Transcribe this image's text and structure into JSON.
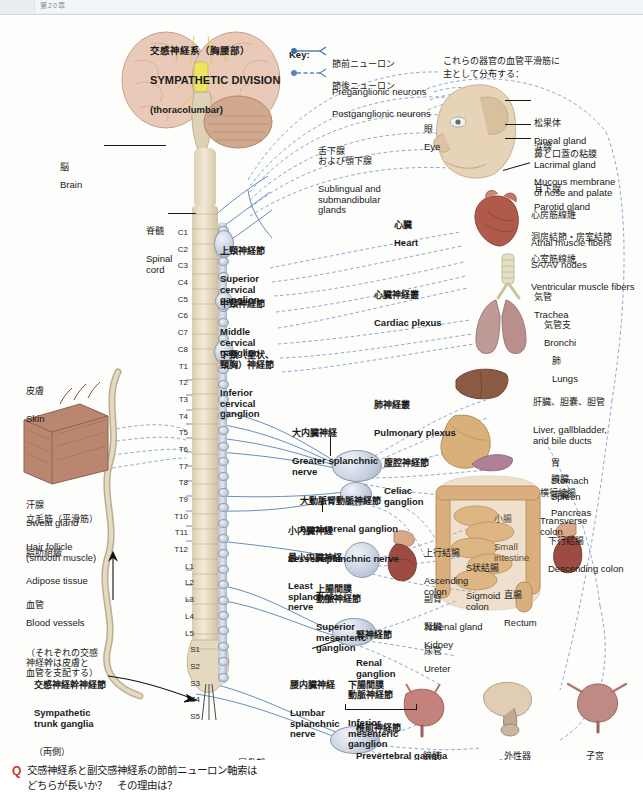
{
  "page": {
    "edge_label": "第20章",
    "width": 643,
    "height": 812
  },
  "title": {
    "jp": "交感神経系（胸腰部）",
    "en": "SYMPATHETIC DIVISION",
    "sub": "(thoracolumbar)"
  },
  "key": {
    "heading": "Key:",
    "items": [
      {
        "jp": "節前ニューロン",
        "en": "Preganglionic neurons",
        "style": "solid",
        "color": "#3f6fa8"
      },
      {
        "jp": "節後ニューロン",
        "en": "Postganglionic neurons",
        "style": "dashed",
        "color": "#3f6fa8"
      }
    ]
  },
  "note_vascular": "これらの器官の血管平滑筋に\n主として分布する：",
  "cns_labels": [
    {
      "jp": "脳",
      "en": "Brain"
    },
    {
      "jp": "脊髄",
      "en": "Spinal\ncord"
    }
  ],
  "spinal_segments": [
    "C1",
    "C2",
    "C3",
    "C4",
    "C5",
    "C6",
    "C7",
    "C8",
    "T1",
    "T2",
    "T3",
    "T4",
    "T5",
    "T6",
    "T7",
    "T8",
    "T9",
    "T10",
    "T11",
    "T12",
    "L1",
    "L2",
    "L3",
    "L4",
    "L5",
    "S1",
    "S2",
    "S3",
    "S4",
    "S5"
  ],
  "coccygeal": {
    "jp": "尾骨部",
    "en": "Coccygeal",
    "note": "（融合する）"
  },
  "cervical_ganglia": [
    {
      "jp": "上頸神経節",
      "en": "Superior\ncervical\nganglion"
    },
    {
      "jp": "中頸神経節",
      "en": "Middle\ncervical\nganglion"
    },
    {
      "jp": "下頸（星状、\n頸胸）神経節",
      "en": "Inferior\ncervical\nganglion"
    }
  ],
  "trunk_ganglia": {
    "jp": "交感神経幹神経節",
    "en": "Sympathetic\ntrunk ganglia",
    "note": "（両側）"
  },
  "splanchnic_nerves": [
    {
      "jp": "大内臓神経",
      "en": "Greater splanchnic\nnerve"
    },
    {
      "jp": "小内臓神経",
      "en": "Lesser splanchnic nerve"
    },
    {
      "jp": "最小内臓神経",
      "en": "Least\nsplanchnic\nnerve"
    },
    {
      "jp": "腰内臓神経",
      "en": "Lumbar\nsplanchnic\nnerve"
    }
  ],
  "prevertebral_ganglia": [
    {
      "jp": "腹腔神経節",
      "en": "Celiac\nganglion"
    },
    {
      "jp": "大動脈腎動脈神経節",
      "en": "Aorticorenal ganglion"
    },
    {
      "jp": "上腸間膜\n動脈神経節",
      "en": "Superior\nmesenteric\nganglion"
    },
    {
      "jp": "腎神経節",
      "en": "Renal\nganglion"
    },
    {
      "jp": "下腸間膜\n動脈神経節",
      "en": "Inferior\nmesenteric\nganglion"
    }
  ],
  "prevertebral_group": {
    "jp": "椎前神経節",
    "en": "Prevertebral ganglia"
  },
  "plexuses": [
    {
      "jp": "心臓神経叢",
      "en": "Cardiac plexus"
    },
    {
      "jp": "肺神経叢",
      "en": "Pulmonary plexus"
    },
    {
      "jp": "下腹神経叢",
      "en": "Hypogastric plexus"
    }
  ],
  "skin_block": {
    "title": {
      "jp": "皮膚",
      "en": "Skin"
    },
    "items": [
      {
        "jp": "汗腺",
        "en": "Sweat gland",
        "inline": true
      },
      {
        "jp": "立毛筋（平滑筋）",
        "en": "Hair follicle\n(smooth muscle)",
        "inline": false
      },
      {
        "jp": "脂肪組織",
        "en": "Adipose tissue",
        "inline": false
      },
      {
        "jp": "血管",
        "en": "Blood vessels",
        "inline": true,
        "note": "（それぞれの交感\n神経幹は皮膚と\n血管を支配する）"
      }
    ]
  },
  "organ_labels": [
    {
      "jp": "眼",
      "en": "Eye"
    },
    {
      "jp": "松果体",
      "en": "Pineal gland"
    },
    {
      "jp": "涙腺",
      "en": "Lacrimal gland"
    },
    {
      "jp": "鼻と口蓋の粘膜",
      "en": "Mucous membrane\nof nose and palate"
    },
    {
      "jp": "耳下腺",
      "en": "Parotid gland"
    },
    {
      "jp": "舌下腺\nおよび顎下腺",
      "en": "Sublingual and\nsubmandibular\nglands"
    },
    {
      "jp": "心臓",
      "en": "Heart"
    },
    {
      "jp": "心房筋線維",
      "en": "Atrial muscle fibers"
    },
    {
      "jp": "洞房結節・房室結節",
      "en": "SA/AV nodes"
    },
    {
      "jp": "心室筋線維",
      "en": "Ventricular muscle fibers"
    },
    {
      "jp": "気管",
      "en": "Trachea"
    },
    {
      "jp": "気管支",
      "en": "Bronchi"
    },
    {
      "jp": "肺",
      "en": "Lungs"
    },
    {
      "jp": "肝臓、胆嚢、胆管",
      "en": "Liver, gallbladder,\nand bile ducts"
    },
    {
      "jp": "胃",
      "en": "Stomach"
    },
    {
      "jp": "脾臓",
      "en": "Spleen"
    },
    {
      "jp": "膵臓",
      "en": "Pancreas"
    },
    {
      "jp": "小腸",
      "en": "Small\nintestine"
    },
    {
      "jp": "横行結腸",
      "en": "Transverse\ncolon"
    },
    {
      "jp": "下行結腸",
      "en": "Descending colon"
    },
    {
      "jp": "上行結腸",
      "en": "Ascending\ncolon"
    },
    {
      "jp": "S状結腸",
      "en": "Sigmoid\ncolon"
    },
    {
      "jp": "直腸",
      "en": "Rectum"
    },
    {
      "jp": "副腎",
      "en": "Adrenal gland"
    },
    {
      "jp": "腎臓",
      "en": "Kidney"
    },
    {
      "jp": "尿管",
      "en": "Ureter"
    },
    {
      "jp": "膀胱",
      "en": "Urinary bladder"
    },
    {
      "jp": "外性器",
      "en": "External genitals"
    },
    {
      "jp": "子宮",
      "en": "Uterus"
    }
  ],
  "question": {
    "marker": "Q",
    "text": "交感神経系と副交感神経系の節前ニューロン軸索は\nどちらが長いか？　その理由は？"
  },
  "colors": {
    "preganglionic": "#3f6fa8",
    "postganglionic": "#5b86b8",
    "question_marker": "#c0392b",
    "cord": "#e8dec6",
    "ganglion": "#cfd8e6"
  }
}
